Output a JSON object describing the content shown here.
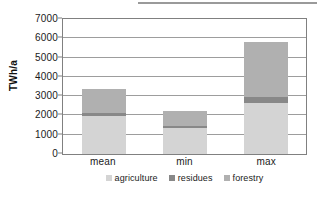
{
  "chart_data": {
    "type": "bar",
    "subtype": "stacked-bar",
    "title": "",
    "xlabel": "",
    "ylabel": "TWh/a",
    "categories": [
      "mean",
      "min",
      "max"
    ],
    "series": [
      {
        "name": "agriculture",
        "color": "#d4d4d4",
        "values": [
          1950,
          1330,
          2670
        ]
      },
      {
        "name": "residues",
        "color": "#888888",
        "values": [
          200,
          130,
          270
        ]
      },
      {
        "name": "forestry",
        "color": "#b0b0b0",
        "values": [
          1220,
          760,
          2860
        ]
      }
    ],
    "totals": [
      3370,
      2220,
      5800
    ],
    "ylim": [
      0,
      7000
    ],
    "ytick_step": 1000,
    "yticks": [
      "7000",
      "6000",
      "5000",
      "4000",
      "3000",
      "2000",
      "1000",
      "0"
    ],
    "ytick_values": [
      7000,
      6000,
      5000,
      4000,
      3000,
      2000,
      1000,
      0
    ],
    "grid": true,
    "grid_axis": "y",
    "legend_position": "bottom",
    "legend": [
      "agriculture",
      "residues",
      "forestry"
    ],
    "plot_border_color": "#808080",
    "gridline_color": "#9d9d9d",
    "background": "#ffffff"
  }
}
